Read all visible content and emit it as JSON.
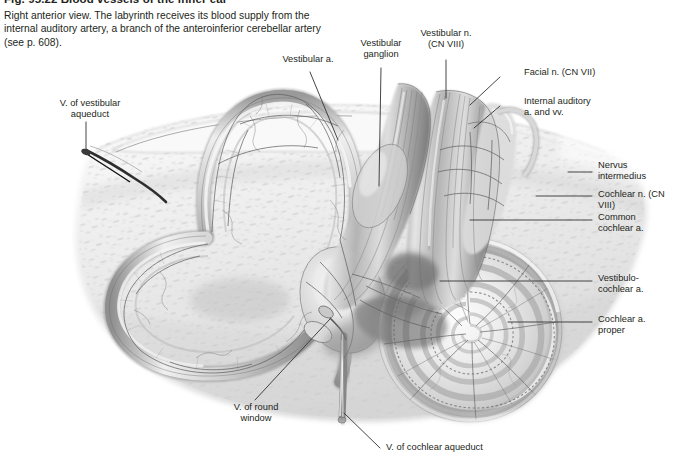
{
  "figure": {
    "title": "Fig. 95.22  Blood vessels of the inner ear",
    "caption": "Right anterior view. The labyrinth receives its blood supply from the internal auditory artery, a branch of the anteroinferior cerebellar artery (see p. 608).",
    "background_color": "#ffffff",
    "text_color": "#231f20",
    "leader_color": "#3b3b3b"
  },
  "labels": {
    "vestibular_aqueduct_vein": "V. of vestibular\naqueduct",
    "vestibular_artery": "Vestibular a.",
    "vestibular_ganglion": "Vestibular\nganglion",
    "vestibular_nerve": "Vestibular n.\n(CN VIII)",
    "facial_nerve": "Facial n. (CN VII)",
    "internal_auditory": "Internal auditory\na. and vv.",
    "nervus_intermedius": "Nervus\nintermedius",
    "cochlear_nerve": "Cochlear n. (CN VIII)",
    "common_cochlear_artery": "Common\ncochlear a.",
    "vestibulocochlear_artery": "Vestibulo-\ncochlear a.",
    "cochlear_artery_proper": "Cochlear a.\nproper",
    "round_window_vein": "V. of round\nwindow",
    "cochlear_aqueduct_vein": "V. of cochlear aqueduct"
  },
  "illustration": {
    "name": "inner-ear-labyrinth-vasculature",
    "style": "grayscale pencil anatomical rendering",
    "structures": [
      "anterior semicircular canal",
      "lateral semicircular canal",
      "posterior semicircular canal",
      "vestibule",
      "cochlea spiral",
      "vestibulocochlear nerve trunk",
      "petrous bone face",
      "vascular plexus"
    ]
  }
}
